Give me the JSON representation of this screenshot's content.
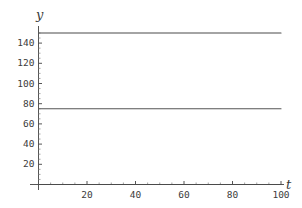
{
  "chart_data": {
    "type": "line",
    "title": "",
    "subtitle": "",
    "xlabel": "t",
    "ylabel": "y",
    "xlim": [
      0,
      105
    ],
    "ylim": [
      0,
      152
    ],
    "grid": false,
    "legend": "none",
    "equilibrium": 75,
    "xticks": [
      {
        "value": 20,
        "label": "20"
      },
      {
        "value": 40,
        "label": "40"
      },
      {
        "value": 60,
        "label": "60"
      },
      {
        "value": 80,
        "label": "80"
      },
      {
        "value": 100,
        "label": "100"
      }
    ],
    "yticks": [
      {
        "value": 20,
        "label": "20"
      },
      {
        "value": 40,
        "label": "40"
      },
      {
        "value": 60,
        "label": "60"
      },
      {
        "value": 80,
        "label": "80"
      },
      {
        "value": 100,
        "label": "100"
      },
      {
        "value": 120,
        "label": "120"
      },
      {
        "value": 140,
        "label": "140"
      }
    ],
    "x": [
      0,
      5,
      10,
      15,
      20,
      25,
      30,
      35,
      40,
      45,
      50,
      55,
      60,
      65,
      70,
      75,
      80,
      85,
      90,
      95,
      100
    ],
    "series": [
      {
        "name": "upper-solution",
        "color": "#4a4a4a",
        "values": [
          150.0,
          139.4,
          130.1,
          121.8,
          114.6,
          108.3,
          102.7,
          97.8,
          93.5,
          89.8,
          86.5,
          83.6,
          81.0,
          78.8,
          76.9,
          75.2,
          73.7,
          72.4,
          71.3,
          70.3,
          69.5
        ]
      },
      {
        "name": "equilibrium-solution",
        "color": "#555555",
        "values": [
          75,
          75,
          75,
          75,
          75,
          75,
          75,
          75,
          75,
          75,
          75,
          75,
          75,
          75,
          75,
          75,
          75,
          75,
          75,
          75,
          75
        ]
      },
      {
        "name": "lower-solution",
        "color": "#4a4a4a",
        "values": [
          0.0,
          11.8,
          22.2,
          31.4,
          39.4,
          46.5,
          52.7,
          58.2,
          63.0,
          67.2,
          70.9,
          74.2,
          77.0,
          79.5,
          81.7,
          83.6,
          85.3,
          86.8,
          88.1,
          89.2,
          90.2
        ]
      }
    ]
  },
  "axes": {
    "y_axis_label": "y",
    "x_axis_label": "t"
  }
}
